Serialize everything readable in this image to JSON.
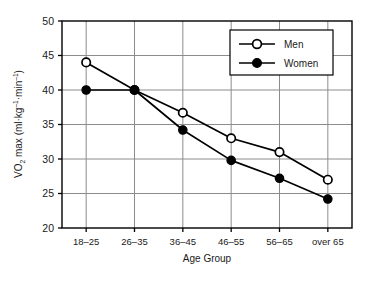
{
  "chart_data": {
    "type": "line",
    "title": "",
    "xlabel": "Age Group",
    "ylabel_parts": {
      "v": "V",
      "dot": "̇",
      "o": "O",
      "two": "2",
      "max": " max (ml·kg",
      "exp1": "–1",
      "mid": "·min",
      "exp2": "–1",
      "close": ")"
    },
    "ylabel": "V̇O2 max (ml·kg–1·min–1)",
    "categories": [
      "18–25",
      "26–35",
      "36–45",
      "46–55",
      "56–65",
      "over 65"
    ],
    "yticks": [
      50,
      45,
      40,
      35,
      30,
      25,
      20
    ],
    "ylim": [
      20,
      50
    ],
    "grid": true,
    "legend_position": "top-right-inside",
    "series": [
      {
        "name": "Men",
        "marker": "open-circle",
        "values": [
          44.0,
          40.0,
          36.7,
          33.0,
          31.0,
          27.0
        ]
      },
      {
        "name": "Women",
        "marker": "filled-circle",
        "values": [
          40.0,
          40.0,
          34.2,
          29.8,
          27.2,
          24.2
        ]
      }
    ]
  },
  "colors": {
    "line": "#000000",
    "grid": "#8c8c8c",
    "axis": "#000000",
    "background": "#ffffff",
    "marker_fill_open": "#ffffff",
    "marker_fill_solid": "#000000"
  }
}
